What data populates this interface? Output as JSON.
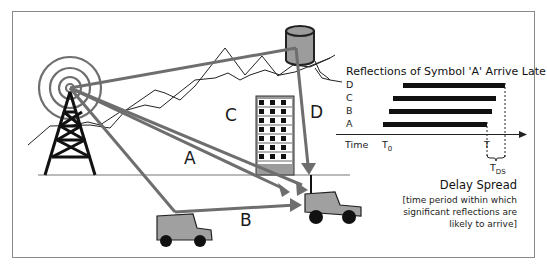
{
  "figure": {
    "paths": [
      {
        "label": "A",
        "description": "direct path from tower to car"
      },
      {
        "label": "B",
        "description": "reflection off parked vehicle"
      },
      {
        "label": "C",
        "description": "reflection off building"
      },
      {
        "label": "D",
        "description": "reflection off water tower"
      }
    ],
    "colors": {
      "ray": "#6e6e6e",
      "vehicle": "#a0a0a0",
      "tower": "#111111",
      "frame": "#8a8a8a"
    }
  },
  "timing": {
    "title": "Reflections of Symbol 'A' Arrive Late",
    "rows": [
      {
        "label": "D"
      },
      {
        "label": "C"
      },
      {
        "label": "B"
      },
      {
        "label": "A"
      }
    ],
    "axis_label": "Time",
    "t0_label": "T",
    "t0_sub": "0",
    "t_label": "T",
    "tds_label": "T",
    "tds_sub": "DS",
    "delay_spread_title": "Delay Spread",
    "delay_spread_note_1": "[time period within which",
    "delay_spread_note_2": "significant reflections are",
    "delay_spread_note_3": "likely to arrive]"
  }
}
